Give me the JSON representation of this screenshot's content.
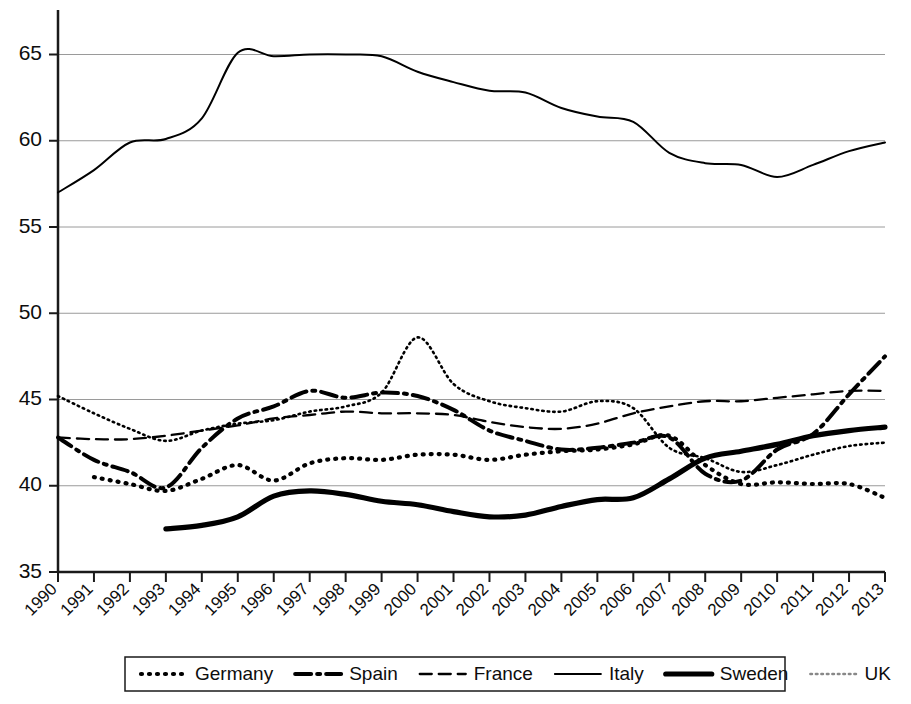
{
  "chart_data": {
    "type": "line",
    "title": "",
    "subtitle": "",
    "xlabel": "",
    "ylabel": "",
    "grid": true,
    "legend_position": "bottom",
    "xlim": [
      1990,
      2013
    ],
    "ylim": [
      35,
      67
    ],
    "y_ticks": [
      35,
      40,
      45,
      50,
      55,
      60,
      65
    ],
    "x_ticks": [
      "1990",
      "1991",
      "1992",
      "1993",
      "1994",
      "1995",
      "1996",
      "1997",
      "1998",
      "1999",
      "2000",
      "2001",
      "2002",
      "2003",
      "2004",
      "2005",
      "2006",
      "2007",
      "2008",
      "2009",
      "2010",
      "2011",
      "2012",
      "2013"
    ],
    "categories": [
      1990,
      1991,
      1992,
      1993,
      1994,
      1995,
      1996,
      1997,
      1998,
      1999,
      2000,
      2001,
      2002,
      2003,
      2004,
      2005,
      2006,
      2007,
      2008,
      2009,
      2010,
      2011,
      2012,
      2013
    ],
    "series": [
      {
        "name": "Germany",
        "style": "dotted",
        "dash": "1,7",
        "width": 4.2,
        "color": "#000000",
        "x": [
          1991,
          1992,
          1993,
          1994,
          1995,
          1996,
          1997,
          1998,
          1999,
          2000,
          2001,
          2002,
          2003,
          2004,
          2005,
          2006,
          2007,
          2008,
          2009,
          2010,
          2011,
          2012,
          2013
        ],
        "values": [
          40.5,
          40.1,
          39.7,
          40.4,
          41.2,
          40.3,
          41.3,
          41.6,
          41.5,
          41.8,
          41.8,
          41.5,
          41.8,
          42.0,
          42.1,
          42.4,
          42.9,
          41.2,
          40.1,
          40.2,
          40.1,
          40.1,
          39.3
        ]
      },
      {
        "name": "Spain",
        "style": "dash-dot",
        "dash": "16,6,3,6",
        "width": 4.0,
        "color": "#000000",
        "x": [
          1990,
          1991,
          1992,
          1993,
          1994,
          1995,
          1996,
          1997,
          1998,
          1999,
          2000,
          2001,
          2002,
          2003,
          2004,
          2005,
          2006,
          2007,
          2008,
          2009,
          2010,
          2011,
          2012,
          2013
        ],
        "values": [
          42.8,
          41.5,
          40.8,
          39.9,
          42.2,
          43.9,
          44.6,
          45.5,
          45.1,
          45.4,
          45.2,
          44.4,
          43.2,
          42.6,
          42.1,
          42.2,
          42.5,
          42.8,
          40.7,
          40.3,
          42.1,
          43.0,
          45.3,
          47.5
        ]
      },
      {
        "name": "France",
        "style": "dashed",
        "dash": "12,7",
        "width": 2.3,
        "color": "#000000",
        "x": [
          1990,
          1991,
          1992,
          1993,
          1994,
          1995,
          1996,
          1997,
          1998,
          1999,
          2000,
          2001,
          2002,
          2003,
          2004,
          2005,
          2006,
          2007,
          2008,
          2009,
          2010,
          2011,
          2012,
          2013
        ],
        "values": [
          42.8,
          42.7,
          42.7,
          42.9,
          43.2,
          43.5,
          43.9,
          44.1,
          44.3,
          44.2,
          44.2,
          44.1,
          43.7,
          43.4,
          43.3,
          43.6,
          44.2,
          44.6,
          44.9,
          44.9,
          45.1,
          45.3,
          45.5,
          45.5
        ]
      },
      {
        "name": "Italy",
        "style": "solid-thin",
        "dash": "none",
        "width": 2.0,
        "color": "#000000",
        "x": [
          1990,
          1991,
          1992,
          1993,
          1994,
          1995,
          1996,
          1997,
          1998,
          1999,
          2000,
          2001,
          2002,
          2003,
          2004,
          2005,
          2006,
          2007,
          2008,
          2009,
          2010,
          2011,
          2012,
          2013
        ],
        "values": [
          57.0,
          58.3,
          59.9,
          60.1,
          61.3,
          65.1,
          64.9,
          65.0,
          65.0,
          64.9,
          64.0,
          63.4,
          62.9,
          62.8,
          61.9,
          61.4,
          61.1,
          59.3,
          58.7,
          58.6,
          57.9,
          58.6,
          59.4,
          59.9
        ]
      },
      {
        "name": "Sweden",
        "style": "solid-thick",
        "dash": "none",
        "width": 5.2,
        "color": "#000000",
        "x": [
          1993,
          1994,
          1995,
          1996,
          1997,
          1998,
          1999,
          2000,
          2001,
          2002,
          2003,
          2004,
          2005,
          2006,
          2007,
          2008,
          2009,
          2010,
          2011,
          2012,
          2013
        ],
        "values": [
          37.5,
          37.7,
          38.2,
          39.4,
          39.7,
          39.5,
          39.1,
          38.9,
          38.5,
          38.2,
          38.3,
          38.8,
          39.2,
          39.3,
          40.4,
          41.6,
          42.0,
          42.4,
          42.9,
          43.2,
          43.4
        ]
      },
      {
        "name": "UK",
        "style": "fine-dotted",
        "dash": "1.5,4",
        "width": 2.6,
        "color": "#888888",
        "x": [
          1990,
          1991,
          1992,
          1993,
          1994,
          1995,
          1996,
          1997,
          1998,
          1999,
          2000,
          2001,
          2002,
          2003,
          2004,
          2005,
          2006,
          2007,
          2008,
          2009,
          2010,
          2011,
          2012,
          2013
        ],
        "values": [
          45.2,
          44.2,
          43.3,
          42.6,
          43.2,
          43.6,
          43.8,
          44.3,
          44.6,
          45.4,
          48.6,
          45.9,
          44.9,
          44.5,
          44.3,
          44.9,
          44.5,
          42.2,
          41.6,
          40.8,
          41.2,
          41.8,
          42.3,
          42.5
        ]
      }
    ]
  },
  "legend": {
    "items": [
      {
        "label": "Germany",
        "key": "Germany"
      },
      {
        "label": "Spain",
        "key": "Spain"
      },
      {
        "label": "France",
        "key": "France"
      },
      {
        "label": "Italy",
        "key": "Italy"
      },
      {
        "label": "Sweden",
        "key": "Sweden"
      },
      {
        "label": "UK",
        "key": "UK"
      }
    ]
  },
  "colors": {
    "ink": "#000000",
    "grid": "#9a9a9a",
    "uk_gray": "#888888",
    "background": "#ffffff"
  }
}
